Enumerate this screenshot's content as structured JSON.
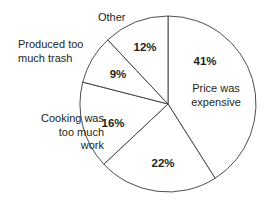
{
  "chart_data": {
    "type": "pie",
    "title": "",
    "subtitle": "",
    "legend_position": "none",
    "grid": false,
    "start_angle_deg": 0,
    "direction": "clockwise",
    "center": {
      "x": 168,
      "y": 104
    },
    "radius": 88,
    "categories": [
      "Price was expensive",
      "",
      "Cooking was too much work",
      "Produced too much trash",
      "Other"
    ],
    "values": [
      41,
      22,
      16,
      9,
      12
    ],
    "value_labels": [
      "41%",
      "22%",
      "16%",
      "9%",
      "12%"
    ],
    "slices": [
      {
        "label": "Price was expensive",
        "value": 41,
        "value_label": "41%",
        "start_deg": 0,
        "end_deg": 147.6,
        "fill": "#ffffff",
        "stroke": "#3a3a3a",
        "pct_label_pos": {
          "x": 205,
          "y": 62
        },
        "callout": {
          "text": "Price was\nexpensive",
          "placement": "inside-right"
        }
      },
      {
        "label": "",
        "value": 22,
        "value_label": "22%",
        "start_deg": 147.6,
        "end_deg": 226.8,
        "fill": "#ffffff",
        "stroke": "#3a3a3a",
        "pct_label_pos": {
          "x": 163,
          "y": 164
        },
        "callout": null
      },
      {
        "label": "Cooking was too much work",
        "value": 16,
        "value_label": "16%",
        "start_deg": 226.8,
        "end_deg": 284.4,
        "fill": "#ffffff",
        "stroke": "#3a3a3a",
        "pct_label_pos": {
          "x": 113,
          "y": 124
        },
        "callout": {
          "text": "Cooking was\ntoo much\nwork",
          "placement": "outside-left"
        }
      },
      {
        "label": "Produced too much trash",
        "value": 9,
        "value_label": "9%",
        "start_deg": 284.4,
        "end_deg": 316.8,
        "fill": "#ffffff",
        "stroke": "#3a3a3a",
        "pct_label_pos": {
          "x": 118,
          "y": 75
        },
        "callout": {
          "text": "Produced too\nmuch trash",
          "placement": "outside-upper-left"
        }
      },
      {
        "label": "Other",
        "value": 12,
        "value_label": "12%",
        "start_deg": 316.8,
        "end_deg": 360,
        "fill": "#ffffff",
        "stroke": "#3a3a3a",
        "pct_label_pos": {
          "x": 145,
          "y": 48
        },
        "callout": {
          "text": "Other",
          "placement": "outside-top"
        }
      }
    ],
    "xlabel": "",
    "ylabel": "",
    "colors": {
      "background": "#ffffff",
      "outline": "#3a3a3a",
      "text": "#231f20"
    }
  },
  "labels": {
    "other": "Other",
    "trash": "Produced too\nmuch trash",
    "cooking": "Cooking was\ntoo much\nwork",
    "price": "Price was\nexpensive"
  },
  "percents": {
    "price": "41%",
    "unlabeled": "22%",
    "cooking": "16%",
    "trash": "9%",
    "other": "12%"
  }
}
